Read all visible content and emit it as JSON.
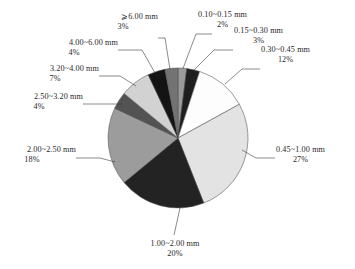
{
  "chart_data": {
    "type": "pie",
    "title": "",
    "subtitle": "",
    "xlabel": "",
    "ylabel": "",
    "legend_position": "none",
    "grid": false,
    "labels_show_percent": true,
    "unit": "mm",
    "categories": [
      "0.10~0.15 mm",
      "0.15~0.30 mm",
      "0.30~0.45 mm",
      "0.45~1.00 mm",
      "1.00~2.00 mm",
      "2.00~2.50 mm",
      "2.50~3.20 mm",
      "3.20~4.00 mm",
      "4.00~6.00 mm",
      "⩾6.00 mm"
    ],
    "values": [
      2,
      3,
      12,
      27,
      20,
      18,
      4,
      7,
      4,
      3
    ],
    "value_labels": [
      "2%",
      "3%",
      "12%",
      "27%",
      "20%",
      "18%",
      "4%",
      "7%",
      "4%",
      "3%"
    ],
    "colors": [
      "#9a9a9a",
      "#1e1e1e",
      "#fdfdfd",
      "#e3e3e3",
      "#232323",
      "#9c9c9c",
      "#535353",
      "#d2d2d2",
      "#141414",
      "#737373"
    ],
    "slices": [
      {
        "label": "0.10~0.15 mm",
        "percent": "2%",
        "value": 2,
        "color": "#9a9a9a"
      },
      {
        "label": "0.15~0.30 mm",
        "percent": "3%",
        "value": 3,
        "color": "#1e1e1e"
      },
      {
        "label": "0.30~0.45 mm",
        "percent": "12%",
        "value": 12,
        "color": "#fdfdfd"
      },
      {
        "label": "0.45~1.00 mm",
        "percent": "27%",
        "value": 27,
        "color": "#e3e3e3"
      },
      {
        "label": "1.00~2.00 mm",
        "percent": "20%",
        "value": 20,
        "color": "#232323"
      },
      {
        "label": "2.00~2.50 mm",
        "percent": "18%",
        "value": 18,
        "color": "#9c9c9c"
      },
      {
        "label": "2.50~3.20 mm",
        "percent": "4%",
        "value": 4,
        "color": "#535353"
      },
      {
        "label": "3.20~4.00 mm",
        "percent": "7%",
        "value": 7,
        "color": "#d2d2d2"
      },
      {
        "label": "4.00~6.00 mm",
        "percent": "4%",
        "value": 4,
        "color": "#141414"
      },
      {
        "label": "⩾6.00 mm",
        "percent": "3%",
        "value": 3,
        "color": "#737373"
      }
    ]
  },
  "callouts": {
    "c0": {
      "name": "0.10~0.15 mm",
      "percent": "2%"
    },
    "c1": {
      "name": "0.15~0.30 mm",
      "percent": "3%"
    },
    "c2": {
      "name": "0.30~0.45 mm",
      "percent": "12%"
    },
    "c3": {
      "name": "0.45~1.00 mm",
      "percent": "27%"
    },
    "c4": {
      "name": "1.00~2.00 mm",
      "percent": "20%"
    },
    "c5": {
      "name": "2.00~2.50 mm",
      "percent": "18%"
    },
    "c6": {
      "name": "2.50~3.20 mm",
      "percent": "4%"
    },
    "c7": {
      "name": "3.20~4.00 mm",
      "percent": "7%"
    },
    "c8": {
      "name": "4.00~6.00 mm",
      "percent": "4%"
    },
    "c9": {
      "name": "⩾6.00 mm",
      "percent": "3%"
    }
  }
}
